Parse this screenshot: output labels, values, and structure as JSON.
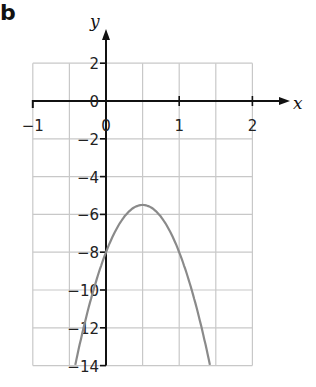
{
  "question_label": "b",
  "chart_data": {
    "type": "line",
    "title": "",
    "xlabel": "x",
    "ylabel": "y",
    "xlim": [
      -1,
      2
    ],
    "ylim": [
      -14,
      2
    ],
    "x_ticks": [
      -1,
      0,
      1,
      2
    ],
    "x_tick_labels": [
      "−1",
      "0",
      "1",
      "2"
    ],
    "y_ticks": [
      2,
      0,
      -2,
      -4,
      -6,
      -8,
      -10,
      -12,
      -14
    ],
    "y_tick_labels": [
      "2",
      "0",
      "−2",
      "−4",
      "−6",
      "−8",
      "−10",
      "−12",
      "−14"
    ],
    "grid": true,
    "grid_x_step": 0.5,
    "grid_y_step": 2,
    "legend": null,
    "series": [
      {
        "name": "y = -10(x - 0.5)^2 - 5.5",
        "description": "Downward parabola, vertex (0.5, -5.5), y-intercept -8",
        "x": [
          -0.42,
          -0.3,
          -0.2,
          -0.1,
          0,
          0.1,
          0.2,
          0.3,
          0.4,
          0.5,
          0.6,
          0.7,
          0.8,
          0.9,
          1.0,
          1.1,
          1.2,
          1.3,
          1.42
        ],
        "y": [
          -14,
          -11.9,
          -10.4,
          -9.1,
          -8,
          -7.1,
          -6.4,
          -5.9,
          -5.6,
          -5.5,
          -5.6,
          -5.9,
          -6.4,
          -7.1,
          -8,
          -9.1,
          -10.4,
          -11.9,
          -14
        ]
      }
    ],
    "colors": {
      "curve": "#8a8a8a",
      "axes": "#111111",
      "grid": "#c8c8c8"
    }
  }
}
